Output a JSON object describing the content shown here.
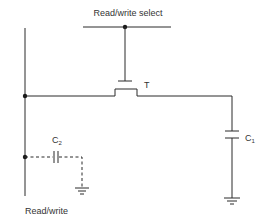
{
  "diagram": {
    "type": "circuit-schematic",
    "labels": {
      "select_line": "Read/write select",
      "transistor": "T",
      "storage_cap": {
        "main": "C",
        "sub": "1"
      },
      "parasitic_cap": {
        "main": "C",
        "sub": "2"
      },
      "data_line": "Read/write"
    },
    "components": [
      {
        "id": "T",
        "kind": "transistor (MOSFET)"
      },
      {
        "id": "C1",
        "kind": "capacitor",
        "style": "solid",
        "connected_to": "ground"
      },
      {
        "id": "C2",
        "kind": "capacitor",
        "style": "dashed (parasitic)",
        "connected_to": "ground"
      }
    ],
    "colors": {
      "line": "#2a2a2a",
      "text": "#333333",
      "background": "#ffffff"
    }
  }
}
